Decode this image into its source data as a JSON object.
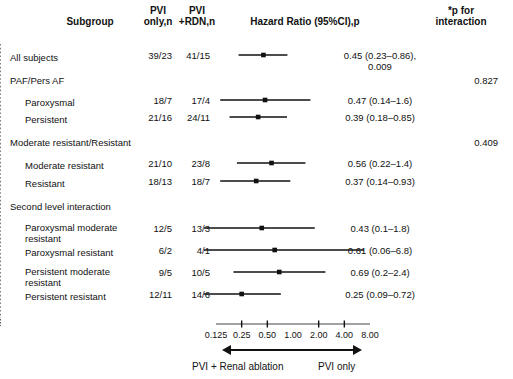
{
  "header": {
    "subgroup": "Subgroup",
    "pvi_only": "PVI\nonly,n",
    "pvi_rdn": "PVI\n+RDN,n",
    "hazard_ratio": "Hazard Ratio (95%CI),p",
    "p_interaction": "*p for\ninteraction"
  },
  "axis": {
    "ticks": [
      "0.125",
      "0.25",
      "0.50",
      "1.00",
      "2.00",
      "4.00",
      "8.00"
    ],
    "tick_values": [
      0.125,
      0.25,
      0.5,
      1.0,
      2.0,
      4.0,
      8.0
    ],
    "min": 0.125,
    "max": 8.0,
    "reference_line": 1.0,
    "left_arrow_label": "PVI + Renal ablation",
    "right_arrow_label": "PVI only"
  },
  "chart_data": {
    "type": "forest",
    "title": "Hazard Ratio (95%CI),p",
    "xlabel": "Hazard Ratio",
    "xscale": "log",
    "xlim": [
      0.125,
      8.0
    ],
    "reference": 1.0,
    "rows": [
      {
        "label": "All subjects",
        "indent": 0,
        "pvi_only": "39/23",
        "pvi_rdn": "41/15",
        "hr_text": "0.45 (0.23–0.86),\n0.009",
        "p_interaction": "",
        "hr": 0.45,
        "lo": 0.23,
        "hi": 0.86,
        "p": 0.009,
        "has_marker": true
      },
      {
        "label": "PAF/Pers AF",
        "indent": 0,
        "pvi_only": "",
        "pvi_rdn": "",
        "hr_text": "",
        "p_interaction": "0.827",
        "has_marker": false
      },
      {
        "label": "Paroxysmal",
        "indent": 1,
        "pvi_only": "18/7",
        "pvi_rdn": "17/4",
        "hr_text": "0.47 (0.14–1.6)",
        "p_interaction": "",
        "hr": 0.47,
        "lo": 0.14,
        "hi": 1.6,
        "has_marker": true
      },
      {
        "label": "Persistent",
        "indent": 1,
        "pvi_only": "21/16",
        "pvi_rdn": "24/11",
        "hr_text": "0.39 (0.18–0.85)",
        "p_interaction": "",
        "hr": 0.39,
        "lo": 0.18,
        "hi": 0.85,
        "has_marker": true
      },
      {
        "label": "Moderate resistant/Resistant",
        "indent": 0,
        "pvi_only": "",
        "pvi_rdn": "",
        "hr_text": "",
        "p_interaction": "0.409",
        "has_marker": false
      },
      {
        "label": "Moderate resistant",
        "indent": 1,
        "pvi_only": "21/10",
        "pvi_rdn": "23/8",
        "hr_text": "0.56 (0.22–1.4)",
        "p_interaction": "",
        "hr": 0.56,
        "lo": 0.22,
        "hi": 1.4,
        "has_marker": true
      },
      {
        "label": "Resistant",
        "indent": 1,
        "pvi_only": "18/13",
        "pvi_rdn": "18/7",
        "hr_text": "0.37 (0.14–0.93)",
        "p_interaction": "",
        "hr": 0.37,
        "lo": 0.14,
        "hi": 0.93,
        "has_marker": true
      },
      {
        "label": "Second level interaction",
        "indent": 0,
        "pvi_only": "",
        "pvi_rdn": "",
        "hr_text": "",
        "p_interaction": "",
        "has_marker": false
      },
      {
        "label": "Paroxysmal moderate\nresistant",
        "indent": 1,
        "pvi_only": "12/5",
        "pvi_rdn": "13/3",
        "hr_text": "0.43 (0.1–1.8)",
        "p_interaction": "",
        "hr": 0.43,
        "lo": 0.1,
        "hi": 1.8,
        "has_marker": true
      },
      {
        "label": "Paroxysmal resistant",
        "indent": 1,
        "pvi_only": "6/2",
        "pvi_rdn": "4/1",
        "hr_text": "0.61 (0.06–6.8)",
        "p_interaction": "",
        "hr": 0.61,
        "lo": 0.06,
        "hi": 6.8,
        "has_marker": true
      },
      {
        "label": "Persistent moderate\nresistant",
        "indent": 1,
        "pvi_only": "9/5",
        "pvi_rdn": "10/5",
        "hr_text": "0.69 (0.2–2.4)",
        "p_interaction": "",
        "hr": 0.69,
        "lo": 0.2,
        "hi": 2.4,
        "has_marker": true
      },
      {
        "label": "Persistent resistant",
        "indent": 1,
        "pvi_only": "12/11",
        "pvi_rdn": "14/6",
        "hr_text": "0.25 (0.09–0.72)",
        "p_interaction": "",
        "hr": 0.25,
        "lo": 0.09,
        "hi": 0.72,
        "has_marker": true
      }
    ]
  },
  "layout": {
    "row_y": [
      55,
      78,
      100,
      117,
      140,
      163,
      181,
      204,
      228,
      250,
      272,
      294
    ],
    "label_y": [
      52,
      75,
      97,
      114,
      137,
      160,
      178,
      201,
      222,
      247,
      266,
      291
    ],
    "plot_left": 216,
    "plot_right": 370
  },
  "colors": {
    "ink": "#111111",
    "axis": "#444444"
  }
}
